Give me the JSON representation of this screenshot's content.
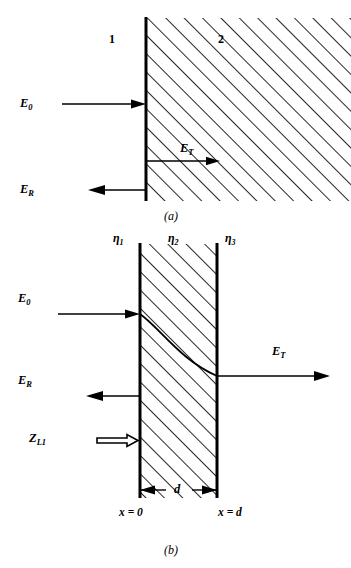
{
  "figure": {
    "type": "physics-diagram"
  },
  "panel_a": {
    "caption": "(a)",
    "region_left_label": "1",
    "region_right_label": "2",
    "incident_label": "E",
    "incident_sub": "0",
    "reflected_label": "E",
    "reflected_sub": "R",
    "transmitted_label": "E",
    "transmitted_sub": "T"
  },
  "panel_b": {
    "caption": "(b)",
    "eta1_label": "η",
    "eta1_sub": "1",
    "eta2_label": "η",
    "eta2_sub": "2",
    "eta3_label": "η",
    "eta3_sub": "3",
    "incident_label": "E",
    "incident_sub": "0",
    "reflected_label": "E",
    "reflected_sub": "R",
    "transmitted_label": "E",
    "transmitted_sub": "T",
    "impedance_label": "Z",
    "impedance_sub": "L1",
    "thickness_label": "d",
    "x_left_label": "x = 0",
    "x_right_label": "x = d"
  },
  "colors": {
    "ink": "#000000",
    "background": "#ffffff"
  }
}
